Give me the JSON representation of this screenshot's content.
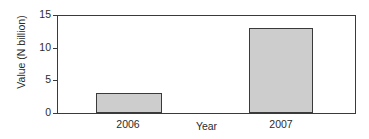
{
  "chart_data": {
    "type": "bar",
    "title": "",
    "categories": [
      "2006",
      "2007"
    ],
    "values": [
      3,
      13
    ],
    "xlabel": "Year",
    "ylabel": "Value (N billion)",
    "ylim": [
      0,
      15
    ],
    "yticks": [
      0,
      5,
      10,
      15
    ],
    "ytick_labels": [
      "0",
      "5",
      "10",
      "15"
    ],
    "grid": false,
    "legend": null,
    "series": [
      {
        "name": "Value (N billion)",
        "values": [
          3,
          13
        ]
      }
    ],
    "bar_fill_color": "#cdcdcd",
    "bar_edge_color": "#3a3a3a",
    "axis_color": "#3a3a3a",
    "background_color": "#ffffff"
  },
  "ticks": {
    "t0": "0",
    "t1": "5",
    "t2": "10",
    "t3": "15"
  },
  "categories": {
    "c0": "2006",
    "c1": "2007"
  },
  "axes": {
    "xlabel": "Year",
    "ylabel": "Value (N billion)"
  }
}
